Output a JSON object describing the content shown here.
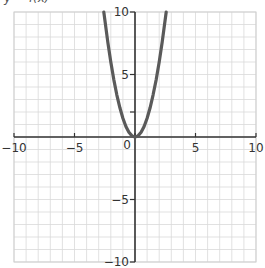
{
  "top_label": "y = f(x)",
  "chart_data": {
    "type": "line",
    "title": "",
    "xlabel": "",
    "ylabel": "",
    "xlim": [
      -10,
      10
    ],
    "ylim": [
      -10,
      10
    ],
    "grid": true,
    "grid_minor_step": 1,
    "x_ticks": [
      -10,
      -5,
      0,
      5,
      10
    ],
    "y_ticks": [
      -10,
      -5,
      5,
      10
    ],
    "x_tick_labels": [
      "−10",
      "−5",
      "0",
      "5",
      "10"
    ],
    "y_tick_labels": [
      "−10",
      "−5",
      "5",
      "10"
    ],
    "y_minor_ticks": [
      2
    ],
    "series": [
      {
        "name": "parabola",
        "equation": "y ≈ 1.5x²",
        "color": "#5a5a5a",
        "x": [
          -2.58,
          -2.25,
          -2,
          -1.75,
          -1.5,
          -1.25,
          -1,
          -0.75,
          -0.5,
          -0.25,
          0,
          0.25,
          0.5,
          0.75,
          1,
          1.25,
          1.5,
          1.75,
          2,
          2.25,
          2.58
        ],
        "y": [
          10,
          7.59,
          6,
          4.59,
          3.38,
          2.34,
          1.5,
          0.84,
          0.38,
          0.09,
          0,
          0.09,
          0.38,
          0.84,
          1.5,
          2.34,
          3.38,
          4.59,
          6,
          7.59,
          10
        ]
      }
    ],
    "legend": null
  },
  "colors": {
    "grid": "#d9d9d9",
    "axis": "#333333",
    "curve": "#5a5a5a",
    "frame": "#cfcfcf"
  }
}
